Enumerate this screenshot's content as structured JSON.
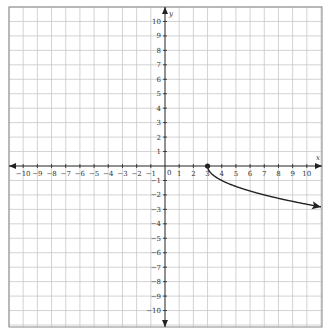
{
  "chart_data": {
    "type": "line",
    "title": "",
    "xlabel": "x",
    "ylabel": "y",
    "xlim": [
      -11,
      11
    ],
    "ylim": [
      -11,
      11
    ],
    "grid": true,
    "x_ticks": [
      -10,
      -9,
      -8,
      -7,
      -6,
      -5,
      -4,
      -3,
      -2,
      -1,
      1,
      2,
      3,
      4,
      5,
      6,
      7,
      8,
      9,
      10
    ],
    "y_ticks": [
      -10,
      -9,
      -8,
      -7,
      -6,
      -5,
      -4,
      -3,
      -2,
      -1,
      1,
      2,
      3,
      4,
      5,
      6,
      7,
      8,
      9,
      10
    ],
    "origin_label": "0",
    "series": [
      {
        "name": "y = -sqrt(x - 3)",
        "start_point": {
          "x": 3,
          "y": 0,
          "closed": true
        },
        "end_arrow": true,
        "x": [
          3,
          3.25,
          4,
          5,
          6,
          7,
          8,
          9,
          10,
          11
        ],
        "y": [
          0,
          -0.5,
          -1,
          -1.41,
          -1.73,
          -2,
          -2.24,
          -2.45,
          -2.65,
          -2.83
        ]
      }
    ]
  },
  "colors": {
    "grid": "#c8c8c8",
    "axis": "#222222",
    "curve": "#222222",
    "border": "#888888"
  }
}
